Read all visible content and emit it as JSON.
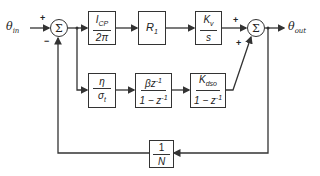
{
  "input": {
    "symbol": "θ",
    "sub": "in"
  },
  "output": {
    "symbol": "θ",
    "sub": "out"
  },
  "sum1": {
    "glyph": "Σ",
    "plus": "+",
    "minus": "−"
  },
  "sum2": {
    "glyph": "Σ",
    "plus_top": "+",
    "plus_bottom": "+"
  },
  "blocks": {
    "charge_pump": {
      "num": "I",
      "num_sub": "CP",
      "den": "2π"
    },
    "resistor": {
      "label": "R",
      "sub": "1"
    },
    "vco": {
      "num": "K",
      "num_sub": "v",
      "den": "s"
    },
    "eta": {
      "num": "η",
      "den": "σ",
      "den_sub": "t"
    },
    "integrator": {
      "num": "βz",
      "num_sup": "-1",
      "den": "1 − z",
      "den_sup": "-1"
    },
    "dso": {
      "num": "K",
      "num_sub": "dso",
      "den": "1 − z",
      "den_sup": "-1"
    },
    "divider": {
      "num": "1",
      "den": "N"
    }
  }
}
